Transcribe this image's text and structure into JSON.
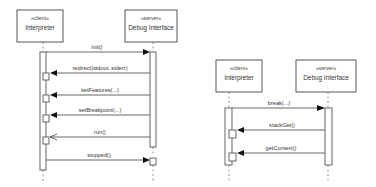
{
  "diagrams": [
    {
      "id": "left",
      "type": "sequence",
      "lifelines": [
        {
          "stereotype": "«client»",
          "name": "Interpreter"
        },
        {
          "stereotype": "«server»",
          "name": "Debug Interface"
        }
      ],
      "messages": [
        {
          "label": "init()",
          "from": "Interpreter",
          "to": "Debug Interface",
          "arrow": "filled"
        },
        {
          "label": "redirect(stdout, stderr)",
          "from": "Debug Interface",
          "to": "Interpreter",
          "arrow": "filled"
        },
        {
          "label": "setFeatures(...)",
          "from": "Debug Interface",
          "to": "Interpreter",
          "arrow": "filled"
        },
        {
          "label": "setBreakpoint(...)",
          "from": "Debug Interface",
          "to": "Interpreter",
          "arrow": "filled"
        },
        {
          "label": "run()",
          "from": "Debug Interface",
          "to": "Interpreter",
          "arrow": "open"
        },
        {
          "label": "stopped()",
          "from": "Interpreter",
          "to": "Debug Interface",
          "arrow": "filled"
        }
      ]
    },
    {
      "id": "right",
      "type": "sequence",
      "lifelines": [
        {
          "stereotype": "«client»",
          "name": "Interpreter"
        },
        {
          "stereotype": "«server»",
          "name": "Debug Interface"
        }
      ],
      "messages": [
        {
          "label": "break(...)",
          "from": "Interpreter",
          "to": "Debug Interface",
          "arrow": "filled"
        },
        {
          "label": "stackGet()",
          "from": "Debug Interface",
          "to": "Interpreter",
          "arrow": "filled"
        },
        {
          "label": "getContext()",
          "from": "Debug Interface",
          "to": "Interpreter",
          "arrow": "filled"
        }
      ]
    }
  ],
  "colors": {
    "line": "#555555",
    "arrowhead": "#111111",
    "text": "#333333"
  }
}
